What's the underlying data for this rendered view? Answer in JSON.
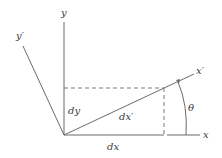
{
  "diagram": {
    "labels": {
      "y_axis": "y",
      "y_prime_axis": "y′",
      "x_axis": "x",
      "x_prime_axis": "x′",
      "dx": "dx",
      "dy": "dy",
      "dx_prime": "dx′",
      "theta": "θ"
    },
    "colors": {
      "line": "#6b6b6b",
      "dashed": "#7a7a7a",
      "text": "#3a3a3a",
      "background": "#ffffff"
    },
    "geometry": {
      "origin": [
        64,
        135
      ],
      "corner": [
        164,
        88
      ],
      "angle_deg": 25
    }
  }
}
